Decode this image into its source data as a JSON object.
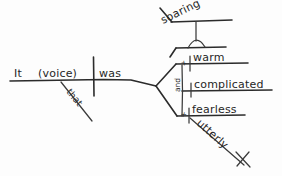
{
  "diagram": {
    "kind": "reed-kellogg-sentence-diagram",
    "style": "hand-drawn pencil on white paper",
    "ink_color": "#2b2b2b",
    "paper_color": "#fdfdfd",
    "sentence": "It was soaring, warm and complicated, utterly fearless, that voice.",
    "baseline": {
      "subject": "It",
      "appositive": "(voice)",
      "verb": "was",
      "divider": "subject-verb-vertical-bar"
    },
    "modifiers": {
      "appositive_modifier": "that",
      "adverb_modifier": "utterly"
    },
    "predicate_adjectives": [
      {
        "label": "warm",
        "connector_mark": "x"
      },
      {
        "label": "complicated",
        "connector_mark": ""
      },
      {
        "label": "fearless",
        "connector_mark": "x"
      }
    ],
    "conjunction": "and",
    "participle": {
      "label": "soaring",
      "pedestal": "arc-pedestal"
    }
  }
}
